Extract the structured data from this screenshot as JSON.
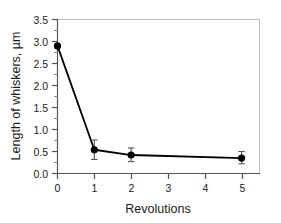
{
  "chart_data": {
    "type": "line",
    "title": "",
    "subtitle": "",
    "xlabel": "Revolutions",
    "ylabel": "Length of whiskers, µm",
    "x": [
      0,
      1,
      2,
      5
    ],
    "values": [
      2.9,
      0.54,
      0.42,
      0.35
    ],
    "error_low": [
      2.9,
      0.32,
      0.27,
      0.22
    ],
    "error_high": [
      2.9,
      0.76,
      0.58,
      0.5
    ],
    "series": [
      {
        "name": "Length of whiskers",
        "x": [
          0,
          1,
          2,
          5
        ],
        "values": [
          2.9,
          0.54,
          0.42,
          0.35
        ],
        "error_low": [
          2.9,
          0.32,
          0.27,
          0.22
        ],
        "error_high": [
          2.9,
          0.76,
          0.58,
          0.5
        ],
        "marker": "filled-circle",
        "color": "#000000"
      }
    ],
    "xlim": [
      0,
      5.5
    ],
    "ylim": [
      0.0,
      3.5
    ],
    "xticks": [
      0,
      1,
      2,
      3,
      4,
      5
    ],
    "xtick_labels": [
      "0",
      "1",
      "2",
      "3",
      "4",
      "5"
    ],
    "yticks": [
      0.0,
      0.5,
      1.0,
      1.5,
      2.0,
      2.5,
      3.0,
      3.5
    ],
    "ytick_labels": [
      "0.0",
      "0.5",
      "1.0",
      "1.5",
      "2.0",
      "2.5",
      "3.0",
      "3.5"
    ],
    "y_minor_ticks": [
      0.25,
      0.75,
      1.25,
      1.75,
      2.25,
      2.75,
      3.25
    ],
    "grid": false,
    "legend": null,
    "legend_position": "none",
    "annotations": [],
    "colors": {
      "line": "#000000",
      "marker": "#000000",
      "error_bar": "#555555",
      "axis": "#555555",
      "frame": "#bdbdbd",
      "text": "#1a1a1a",
      "background": "#ffffff"
    }
  }
}
